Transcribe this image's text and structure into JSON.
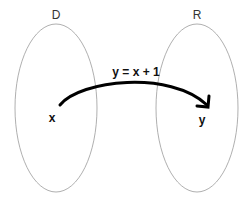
{
  "diagram": {
    "type": "function-mapping",
    "domain_set": {
      "label": "D",
      "element": "x"
    },
    "range_set": {
      "label": "R",
      "element": "y"
    },
    "mapping": {
      "label": "y = x + 1",
      "from": "x",
      "to": "y",
      "color": "#000000"
    },
    "colors": {
      "set_outline": "#9a9a9a",
      "text": "#111111",
      "background": "#ffffff"
    }
  }
}
